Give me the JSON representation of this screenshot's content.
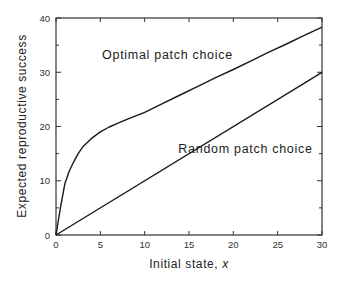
{
  "chart_data": {
    "type": "line",
    "title": "",
    "xlabel": "Initial state, ",
    "xlabel_var": "x",
    "ylabel": "Expected reproductive success",
    "xlim": [
      0,
      30
    ],
    "ylim": [
      0,
      40
    ],
    "x_ticks": [
      0,
      5,
      10,
      15,
      20,
      25,
      30
    ],
    "y_ticks": [
      0,
      10,
      20,
      30,
      40
    ],
    "grid": false,
    "legend": "none (inline annotations)",
    "series": [
      {
        "name": "Optimal patch choice",
        "x": [
          0,
          0.5,
          1,
          1.5,
          2,
          2.5,
          3,
          4,
          5,
          6,
          7,
          8,
          10,
          12,
          14,
          16,
          18,
          20,
          22,
          24,
          26,
          28,
          30
        ],
        "values": [
          0,
          5,
          9.5,
          11.8,
          13.5,
          15,
          16.2,
          17.8,
          19,
          19.9,
          20.6,
          21.3,
          22.6,
          24.2,
          25.8,
          27.4,
          29,
          30.5,
          32.1,
          33.7,
          35.2,
          36.8,
          38.3
        ]
      },
      {
        "name": "Random patch choice",
        "x": [
          0,
          30
        ],
        "values": [
          0,
          30
        ]
      }
    ],
    "annotations": [
      {
        "text": "Optimal patch choice",
        "x": 5.2,
        "y": 32.4
      },
      {
        "text": "Random patch choice",
        "x": 13.8,
        "y": 15.2
      }
    ]
  }
}
